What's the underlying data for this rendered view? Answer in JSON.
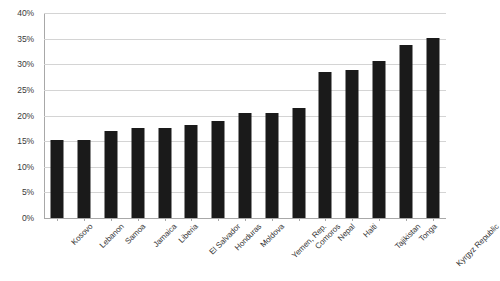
{
  "chart_data": {
    "type": "bar",
    "title": "",
    "subtitle": "",
    "xlabel": "",
    "ylabel": "",
    "ylim": [
      0,
      40
    ],
    "ytick_step": 5,
    "ytick_labels": [
      "0%",
      "5%",
      "10%",
      "15%",
      "20%",
      "25%",
      "30%",
      "35%",
      "40%"
    ],
    "grid": true,
    "legend": false,
    "value_format": "percent",
    "bar_color": "#1a1a1a",
    "gridline_color": "#d4d4d4",
    "axis_color": "#a8a8a8",
    "categories": [
      "Kosovo",
      "Lebanon",
      "Samoa",
      "Jamaica",
      "Liberia",
      "El Salvador",
      "Honduras",
      "Moldova",
      "Yemen, Rep.",
      "Comoros",
      "Nepal",
      "Haiti",
      "Tajikistan",
      "Tonga",
      "Kyrgyz Republic"
    ],
    "values": [
      15.2,
      15.2,
      16.9,
      17.5,
      17.6,
      18.1,
      19.0,
      20.5,
      20.5,
      21.4,
      28.5,
      28.8,
      30.7,
      33.7,
      35.1
    ]
  }
}
